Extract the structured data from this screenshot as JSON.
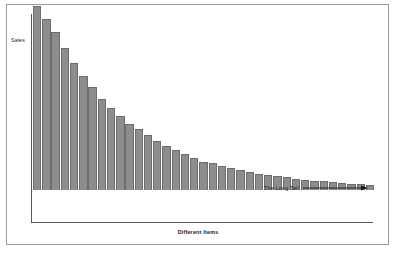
{
  "chart_data": {
    "type": "bar",
    "title": "",
    "xlabel": "Different Items",
    "ylabel": "Sales",
    "grid": false,
    "legend": null,
    "xlim": [
      0,
      37
    ],
    "ylim": [
      0,
      100
    ],
    "categories": [
      "1",
      "2",
      "3",
      "4",
      "5",
      "6",
      "7",
      "8",
      "9",
      "10",
      "11",
      "12",
      "13",
      "14",
      "15",
      "16",
      "17",
      "18",
      "19",
      "20",
      "21",
      "22",
      "23",
      "24",
      "25",
      "26",
      "27",
      "28",
      "29",
      "30",
      "31",
      "32",
      "33",
      "34",
      "35",
      "36",
      "37"
    ],
    "values": [
      97,
      90,
      83,
      75,
      67,
      60,
      54,
      48,
      43,
      39,
      35,
      32,
      29,
      26,
      23,
      21,
      19,
      17,
      15,
      14,
      12.5,
      11.5,
      10.5,
      9.5,
      8.5,
      7.8,
      7.2,
      6.6,
      6.0,
      5.5,
      5.0,
      4.6,
      4.2,
      3.8,
      3.4,
      3.0,
      2.6
    ],
    "annotations": [
      {
        "text": "The Long Tail",
        "arrow": "right-arrow",
        "x_start": 28,
        "x_end": 37
      }
    ]
  },
  "labels": {
    "y_axis": "Sales",
    "x_axis": "Different Items",
    "annotation": "The Long Tail"
  },
  "colors": {
    "bar_fill": "#8d8d8d",
    "bar_stroke": "#6d6d6d",
    "axis": "#5a5a5a",
    "frame": "#9a9a9a",
    "text": "#1a1a1a",
    "background": "#ffffff"
  }
}
